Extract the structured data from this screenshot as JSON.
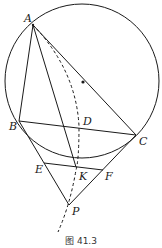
{
  "figure": {
    "caption": "图 41.3",
    "colors": {
      "stroke": "#1a1a1a",
      "background": "#ffffff"
    },
    "circle": {
      "cx": 82,
      "cy": 81,
      "r": 77
    },
    "center_dot": {
      "x": 83,
      "y": 82
    },
    "points": {
      "A": {
        "label": "A",
        "x": 33,
        "y": 25,
        "lx": 24,
        "ly": 22
      },
      "B": {
        "label": "B",
        "x": 19,
        "y": 121,
        "lx": 9,
        "ly": 130
      },
      "C": {
        "label": "C",
        "x": 136,
        "y": 135,
        "lx": 139,
        "ly": 145
      },
      "D": {
        "label": "D",
        "x": 79,
        "y": 126,
        "lx": 83,
        "ly": 125
      },
      "E": {
        "label": "E",
        "x": 44,
        "y": 163,
        "lx": 35,
        "ly": 173
      },
      "K": {
        "label": "K",
        "x": 76,
        "y": 167,
        "lx": 79,
        "ly": 180
      },
      "F": {
        "label": "F",
        "x": 103,
        "y": 170,
        "lx": 105,
        "ly": 180
      },
      "P": {
        "label": "P",
        "x": 69,
        "y": 205,
        "lx": 72,
        "ly": 215
      }
    },
    "segments": [
      {
        "from": "A",
        "to": "B",
        "style": "solid"
      },
      {
        "from": "A",
        "to": "C",
        "style": "solid"
      },
      {
        "from": "A",
        "to": "K",
        "style": "solid"
      },
      {
        "from": "B",
        "to": "C",
        "style": "solid"
      },
      {
        "from": "B",
        "to": "P",
        "style": "solid"
      },
      {
        "from": "C",
        "to": "P",
        "style": "solid"
      },
      {
        "from": "E",
        "to": "F",
        "style": "solid"
      }
    ],
    "dashed_curve": "A through D, K, P extending below P"
  }
}
